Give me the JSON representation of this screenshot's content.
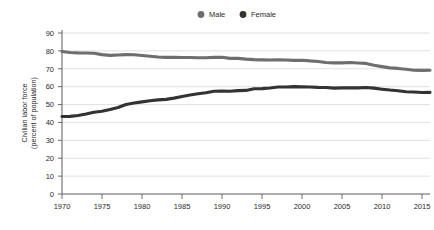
{
  "chart_data": {
    "type": "line",
    "title": "",
    "subtitle": "",
    "xlabel": "",
    "ylabel": "Civilian labor force\n(percent of population)",
    "ylabel_line1": "Civilian labor force",
    "ylabel_line2": "(percent of population)",
    "xlim": [
      1970,
      2016
    ],
    "ylim": [
      0,
      90
    ],
    "ytick_step": 10,
    "xtick_step": 5,
    "grid": "horizontal",
    "legend_position": "top-center",
    "yticks": [
      "0",
      "10",
      "20",
      "30",
      "40",
      "50",
      "60",
      "70",
      "80",
      "90"
    ],
    "xticks": [
      "1970",
      "1975",
      "1980",
      "1985",
      "1990",
      "1995",
      "2000",
      "2005",
      "2010",
      "2015"
    ],
    "x": [
      1970,
      1971,
      1972,
      1973,
      1974,
      1975,
      1976,
      1977,
      1978,
      1979,
      1980,
      1981,
      1982,
      1983,
      1984,
      1985,
      1986,
      1987,
      1988,
      1989,
      1990,
      1991,
      1992,
      1993,
      1994,
      1995,
      1996,
      1997,
      1998,
      1999,
      2000,
      2001,
      2002,
      2003,
      2004,
      2005,
      2006,
      2007,
      2008,
      2009,
      2010,
      2011,
      2012,
      2013,
      2014,
      2015,
      2016
    ],
    "series": [
      {
        "name": "Male",
        "color": "#6e6e6e",
        "marker": "circle",
        "values": [
          79.7,
          79.1,
          78.9,
          78.8,
          78.7,
          77.9,
          77.5,
          77.7,
          77.9,
          77.8,
          77.4,
          77.0,
          76.6,
          76.4,
          76.4,
          76.3,
          76.3,
          76.2,
          76.2,
          76.4,
          76.4,
          75.8,
          75.8,
          75.4,
          75.1,
          75.0,
          74.9,
          75.0,
          74.9,
          74.7,
          74.8,
          74.4,
          74.1,
          73.5,
          73.3,
          73.3,
          73.5,
          73.2,
          73.0,
          72.0,
          71.2,
          70.5,
          70.2,
          69.7,
          69.2,
          69.1,
          69.2
        ]
      },
      {
        "name": "Female",
        "color": "#333333",
        "marker": "circle",
        "values": [
          43.3,
          43.4,
          43.9,
          44.7,
          45.7,
          46.3,
          47.3,
          48.4,
          50.0,
          50.9,
          51.5,
          52.1,
          52.6,
          52.9,
          53.6,
          54.5,
          55.3,
          56.0,
          56.6,
          57.4,
          57.5,
          57.4,
          57.8,
          57.9,
          58.8,
          58.9,
          59.3,
          59.8,
          59.8,
          60.0,
          59.9,
          59.8,
          59.6,
          59.5,
          59.2,
          59.3,
          59.4,
          59.3,
          59.5,
          59.2,
          58.6,
          58.1,
          57.7,
          57.2,
          57.0,
          56.7,
          56.8
        ]
      }
    ],
    "legend": [
      {
        "label": "Male",
        "color": "#6e6e6e"
      },
      {
        "label": "Female",
        "color": "#333333"
      }
    ]
  }
}
